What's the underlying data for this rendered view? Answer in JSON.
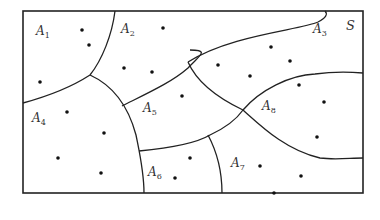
{
  "figure": {
    "set_label": "S",
    "regions": [
      {
        "name": "A",
        "index": "1",
        "label_pos": [
          36,
          35
        ]
      },
      {
        "name": "A",
        "index": "2",
        "label_pos": [
          121,
          33
        ]
      },
      {
        "name": "A",
        "index": "3",
        "label_pos": [
          313,
          33
        ]
      },
      {
        "name": "A",
        "index": "4",
        "label_pos": [
          32,
          122
        ]
      },
      {
        "name": "A",
        "index": "5",
        "label_pos": [
          143,
          112
        ]
      },
      {
        "name": "A",
        "index": "6",
        "label_pos": [
          148,
          176
        ]
      },
      {
        "name": "A",
        "index": "7",
        "label_pos": [
          231,
          167
        ]
      },
      {
        "name": "A",
        "index": "8",
        "label_pos": [
          262,
          110
        ]
      }
    ],
    "points": [
      [
        82,
        30
      ],
      [
        89,
        45
      ],
      [
        40,
        82
      ],
      [
        163,
        28
      ],
      [
        124,
        68
      ],
      [
        152,
        72
      ],
      [
        271,
        47
      ],
      [
        290,
        61
      ],
      [
        218,
        65
      ],
      [
        250,
        76
      ],
      [
        299,
        85
      ],
      [
        324,
        102
      ],
      [
        317,
        137
      ],
      [
        182,
        96
      ],
      [
        67,
        112
      ],
      [
        104,
        133
      ],
      [
        58,
        158
      ],
      [
        101,
        173
      ],
      [
        190,
        158
      ],
      [
        175,
        178
      ],
      [
        260,
        166
      ],
      [
        301,
        176
      ],
      [
        274,
        193
      ]
    ],
    "colors": {
      "stroke": "#222222",
      "point": "#111111",
      "label": "#333333",
      "background": "#ffffff"
    }
  }
}
